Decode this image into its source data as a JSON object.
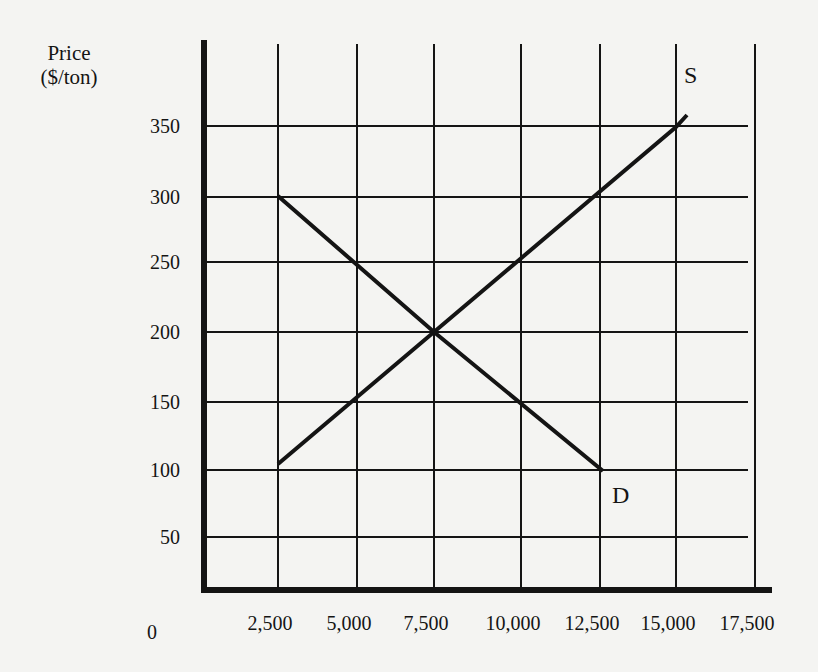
{
  "chart_data": {
    "type": "line",
    "title": "",
    "xlabel": "",
    "ylabel": "Price ($/ton)",
    "ylabel_line1": "Price",
    "ylabel_line2": "($/ton)",
    "origin_label": "0",
    "xlim": [
      0,
      17500
    ],
    "ylim": [
      0,
      375
    ],
    "grid": true,
    "x_ticks": [
      {
        "value": 2500,
        "label": "2,500",
        "px": 278
      },
      {
        "value": 5000,
        "label": "5,000",
        "px": 357
      },
      {
        "value": 7500,
        "label": "7,500",
        "px": 434
      },
      {
        "value": 10000,
        "label": "10,000",
        "px": 521
      },
      {
        "value": 12500,
        "label": "12,500",
        "px": 600
      },
      {
        "value": 15000,
        "label": "15,000",
        "px": 676
      },
      {
        "value": 17500,
        "label": "17,500",
        "px": 755
      }
    ],
    "y_ticks": [
      {
        "value": 350,
        "label": "350",
        "px": 126
      },
      {
        "value": 300,
        "label": "300",
        "px": 197
      },
      {
        "value": 250,
        "label": "250",
        "px": 262
      },
      {
        "value": 200,
        "label": "200",
        "px": 332
      },
      {
        "value": 150,
        "label": "150",
        "px": 402
      },
      {
        "value": 100,
        "label": "100",
        "px": 470
      },
      {
        "value": 50,
        "label": "50",
        "px": 537
      }
    ],
    "series": [
      {
        "name": "S",
        "label": "S",
        "description": "Supply",
        "points": [
          {
            "x": 2500,
            "y": 100
          },
          {
            "x": 7500,
            "y": 200
          },
          {
            "x": 15000,
            "y": 350
          },
          {
            "x": 15500,
            "y": 360
          }
        ],
        "px_points": [
          [
            278,
            464
          ],
          [
            434,
            332
          ],
          [
            676,
            127
          ],
          [
            687,
            115
          ]
        ]
      },
      {
        "name": "D",
        "label": "D",
        "description": "Demand",
        "points": [
          {
            "x": 2500,
            "y": 300
          },
          {
            "x": 7500,
            "y": 200
          },
          {
            "x": 12500,
            "y": 100
          }
        ],
        "px_points": [
          [
            278,
            196
          ],
          [
            434,
            332
          ],
          [
            603,
            471
          ]
        ]
      }
    ],
    "equilibrium": {
      "x": 7500,
      "y": 200
    },
    "legend": "none",
    "annotations": [
      {
        "text": "S",
        "px": [
          684,
          66
        ]
      },
      {
        "text": "D",
        "px": [
          612,
          484
        ]
      }
    ]
  },
  "colors": {
    "background": "#f4f4f2",
    "ink": "#141414"
  }
}
